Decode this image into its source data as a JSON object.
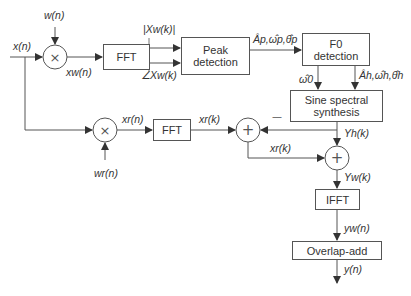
{
  "diagram": {
    "type": "signal-processing block diagram",
    "blocks": {
      "fft_top": "FFT",
      "peak_detection": "Peak detection",
      "f0_detection": "F0 detection",
      "sine_synthesis": "Sine spectral synthesis",
      "fft_bottom": "FFT",
      "ifft": "IFFT",
      "overlap_add": "Overlap-add"
    },
    "signals": {
      "input": "x(n)",
      "window": "w(n)",
      "windowed": "xw(n)",
      "magnitude": "|Xw(k)|",
      "phase": "∠Xw(k)",
      "peaks": "Âp,ω̂p,θ̂p",
      "f0": "ω̂0",
      "harmonics": "Âh,ω̂h,θ̂h",
      "residual_window": "wr(n)",
      "residual_time": "xr(n)",
      "residual_spec": "xr(k)",
      "residual_spec_2": "xr(k)",
      "harmonic_spec": "Yh(k)",
      "sum_spec": "Yw(k)",
      "sum_time": "yw(n)",
      "output": "y(n)"
    },
    "operators": {
      "multiply": "×",
      "add": "+",
      "minus_sign": "—"
    }
  }
}
